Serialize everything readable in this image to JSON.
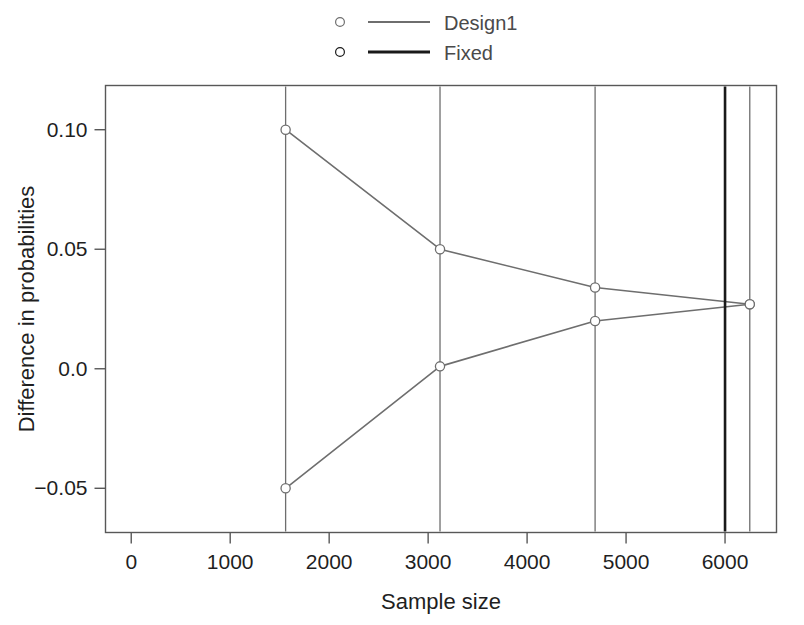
{
  "chart_data": {
    "type": "line",
    "title": "",
    "xlabel": "Sample size",
    "ylabel": "Difference in probabilities",
    "xlim": [
      -260,
      6520
    ],
    "ylim": [
      -0.0685,
      0.1185
    ],
    "grid": false,
    "legend_position": "top",
    "xticks": [
      0,
      1000,
      2000,
      3000,
      4000,
      5000,
      6000
    ],
    "xticklabels": [
      "0",
      "1000",
      "2000",
      "3000",
      "4000",
      "5000",
      "6000"
    ],
    "yticks": [
      -0.05,
      0.0,
      0.05,
      0.1
    ],
    "yticklabels": [
      "-0.05",
      "0.0",
      "0.05",
      "0.10"
    ],
    "series": [
      {
        "name": "Design1",
        "color": "#6e6e6e",
        "marker": "circle-open",
        "linewidth": 1.6,
        "branches": [
          {
            "name": "upper-boundary",
            "x": [
              1560,
              3120,
              4687,
              6250
            ],
            "y": [
              0.1,
              0.05,
              0.034,
              0.027
            ]
          },
          {
            "name": "lower-boundary",
            "x": [
              1560,
              3120,
              4687,
              6250
            ],
            "y": [
              -0.05,
              0.001,
              0.02,
              0.027
            ]
          }
        ]
      },
      {
        "name": "Fixed",
        "color": "#1a1a1a",
        "marker": "circle-open",
        "linewidth": 2.6,
        "vertical_lines": [
          6000
        ]
      }
    ],
    "stage_lines": {
      "color": "#6e6e6e",
      "linewidth": 1.3,
      "x": [
        1560,
        3120,
        4687,
        6250
      ]
    },
    "annotations": []
  },
  "legend": {
    "entries": [
      {
        "label": "Design1",
        "color": "#6e6e6e",
        "marker": "circle-open",
        "linewidth": 2.0
      },
      {
        "label": "Fixed",
        "color": "#1a1a1a",
        "marker": "circle-open",
        "linewidth": 3.0
      }
    ]
  },
  "axes": {
    "x_title": "Sample size",
    "y_title": "Difference in probabilities",
    "x_tick_labels": [
      "0",
      "1000",
      "2000",
      "3000",
      "4000",
      "5000",
      "6000"
    ],
    "y_tick_labels": [
      "0.10",
      "0.05",
      "0.0",
      "-0.05"
    ]
  },
  "colors": {
    "background": "#ffffff",
    "frame": "#585858",
    "design1": "#6e6e6e",
    "fixed": "#1a1a1a",
    "text": "#1f1f1f"
  }
}
